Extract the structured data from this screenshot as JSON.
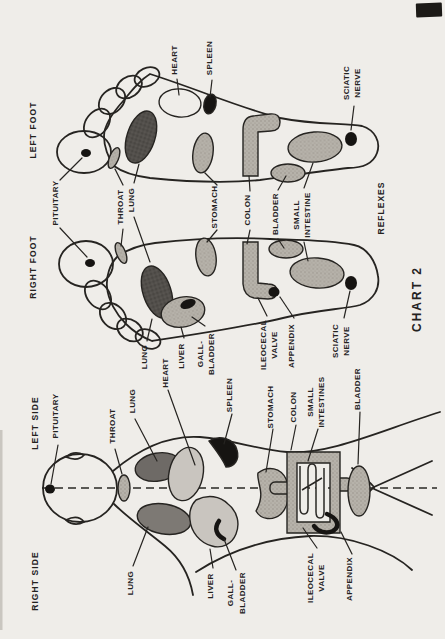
{
  "colors": {
    "paper": "#efede9",
    "ink": "#24221f",
    "zone_gray": "#b6b2aa",
    "zone_dark": "#4c4a47",
    "zone_black": "#161412",
    "body_light": "#c9c5bf",
    "body_lung_dark": "#6e6a66",
    "body_lung_mid": "#7d7974"
  },
  "feet_chart": {
    "left_foot_title": "LEFT FOOT",
    "right_foot_title": "RIGHT FOOT",
    "reflexes_caption": "REFLEXES",
    "chart_caption": "CHART 2",
    "top_labels": {
      "heart": "HEART",
      "spleen": "SPLEEN",
      "sciatic_nerve": [
        "SCIATIC",
        "NERVE"
      ]
    },
    "middle_labels": {
      "pituitary": "PITUITARY",
      "throat": "THROAT",
      "lung": "LUNG",
      "stomach": "STOMACH",
      "colon": "COLON",
      "bladder": "BLADDER",
      "small_intestine": [
        "SMALL",
        "INTESTINE"
      ]
    },
    "bottom_labels": {
      "lung": "LUNG",
      "liver": "LIVER",
      "gall_bladder": [
        "GALL-",
        "BLADDER"
      ],
      "ileocecal_valve": [
        "ILEOCECAL",
        "VALVE"
      ],
      "appendix": "APPENDIX",
      "sciatic_nerve": [
        "SCIATIC",
        "NERVE"
      ]
    }
  },
  "body_chart": {
    "left_side_title": "LEFT SIDE",
    "right_side_title": "RIGHT SIDE",
    "top_labels": {
      "pituitary": "PITUITARY",
      "throat": "THROAT",
      "lung": "LUNG",
      "heart": "HEART",
      "spleen": "SPLEEN",
      "stomach": "STOMACH",
      "colon": "COLON",
      "small_intestines": [
        "SMALL",
        "INTESTINES"
      ],
      "bladder": "BLADDER"
    },
    "bottom_labels": {
      "lung": "LUNG",
      "liver": "LIVER",
      "gall_bladder": [
        "GALL-",
        "BLADDER"
      ],
      "ileocecal_valve": [
        "ILEOCECAL",
        "VALVE"
      ],
      "appendix": "APPENDIX"
    }
  }
}
